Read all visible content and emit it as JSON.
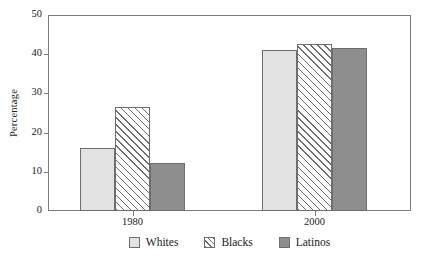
{
  "chart_data": {
    "type": "bar",
    "title": "",
    "subtitle": "",
    "xlabel": "",
    "ylabel": "Percentage",
    "categories": [
      "1980",
      "2000"
    ],
    "series": [
      {
        "name": "Whites",
        "values": [
          16.0,
          41.0
        ],
        "fill": "fill-light",
        "color": "#e3e3e3"
      },
      {
        "name": "Blacks",
        "values": [
          26.5,
          42.5
        ],
        "fill": "fill-hatch",
        "color": "#ffffff"
      },
      {
        "name": "Latinos",
        "values": [
          12.2,
          41.5
        ],
        "fill": "fill-dark",
        "color": "#8e8e8e"
      }
    ],
    "ylim": [
      0,
      50
    ],
    "yticks": [
      "0",
      "10",
      "20",
      "30",
      "40",
      "50"
    ],
    "ytick_values": [
      0,
      10,
      20,
      30,
      40,
      50
    ],
    "grid": false,
    "legend_position": "bottom",
    "frame": true
  },
  "legend": {
    "items": [
      {
        "label": "Whites"
      },
      {
        "label": "Blacks"
      },
      {
        "label": "Latinos"
      }
    ]
  }
}
